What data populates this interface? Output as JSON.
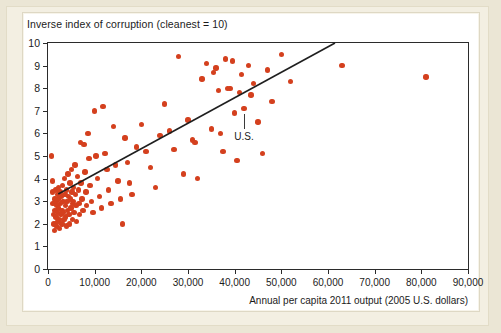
{
  "figure": {
    "panel_background": "#ffffff",
    "page_background": "#ebe6d5",
    "dot_color": "#d4401e",
    "axis_color": "#2b2b2b"
  },
  "chart_data": {
    "type": "scatter",
    "title": "Inverse index of corruption (cleanest = 10)",
    "xlabel": "Annual per capita 2011 output (2005 U.S. dollars)",
    "ylabel": "Inverse index of corruption (cleanest = 10)",
    "xlim": [
      0,
      90000
    ],
    "ylim": [
      0,
      10
    ],
    "grid": false,
    "legend": null,
    "xticks": [
      0,
      10000,
      20000,
      30000,
      40000,
      50000,
      60000,
      70000,
      80000,
      90000
    ],
    "xticklabels": [
      "0",
      "10,000",
      "20,000",
      "30,000",
      "40,000",
      "50,000",
      "60,000",
      "70,000",
      "80,000",
      "90,000"
    ],
    "yticks": [
      0,
      1,
      2,
      3,
      4,
      5,
      6,
      7,
      8,
      9,
      10
    ],
    "yticklabels": [
      "0",
      "1",
      "2",
      "3",
      "4",
      "5",
      "6",
      "7",
      "8",
      "9",
      "10"
    ],
    "trendline": {
      "label": "fitted regression line",
      "x_start": 2200,
      "y_start": 3.32,
      "x_end": 61500,
      "y_end": 10.0,
      "color": "#1f1f1f"
    },
    "annotations": [
      {
        "text": "U.S.",
        "point_x": 42000,
        "point_y": 7.1,
        "label_x": 42000,
        "label_y": 5.75
      }
    ],
    "points": [
      [
        700,
        5.0
      ],
      [
        900,
        3.9
      ],
      [
        1000,
        3.4
      ],
      [
        1100,
        2.9
      ],
      [
        1200,
        2.4
      ],
      [
        1300,
        2.0
      ],
      [
        1400,
        1.7
      ],
      [
        1500,
        3.1
      ],
      [
        1500,
        2.6
      ],
      [
        1600,
        3.5
      ],
      [
        1700,
        3.0
      ],
      [
        1700,
        2.3
      ],
      [
        1800,
        1.9
      ],
      [
        1900,
        2.8
      ],
      [
        2000,
        3.3
      ],
      [
        2000,
        2.5
      ],
      [
        2100,
        2.1
      ],
      [
        2200,
        3.6
      ],
      [
        2300,
        3.1
      ],
      [
        2300,
        2.7
      ],
      [
        2400,
        2.2
      ],
      [
        2500,
        1.8
      ],
      [
        2600,
        3.4
      ],
      [
        2700,
        2.9
      ],
      [
        2800,
        2.4
      ],
      [
        2900,
        3.2
      ],
      [
        3000,
        2.6
      ],
      [
        3000,
        2.0
      ],
      [
        3100,
        3.7
      ],
      [
        3200,
        3.0
      ],
      [
        3300,
        2.5
      ],
      [
        3400,
        2.2
      ],
      [
        3500,
        4.0
      ],
      [
        3600,
        3.3
      ],
      [
        3700,
        2.8
      ],
      [
        3800,
        2.3
      ],
      [
        3900,
        1.9
      ],
      [
        4000,
        3.5
      ],
      [
        4100,
        3.0
      ],
      [
        4200,
        2.6
      ],
      [
        4300,
        4.2
      ],
      [
        4400,
        3.2
      ],
      [
        4500,
        2.4
      ],
      [
        4600,
        2.0
      ],
      [
        4700,
        3.8
      ],
      [
        4800,
        3.1
      ],
      [
        4900,
        2.7
      ],
      [
        5000,
        4.4
      ],
      [
        5100,
        3.4
      ],
      [
        5200,
        2.9
      ],
      [
        5300,
        2.2
      ],
      [
        5400,
        3.6
      ],
      [
        5500,
        3.0
      ],
      [
        5600,
        2.5
      ],
      [
        5800,
        4.6
      ],
      [
        5900,
        3.3
      ],
      [
        6000,
        2.8
      ],
      [
        6100,
        2.1
      ],
      [
        6300,
        4.1
      ],
      [
        6500,
        3.5
      ],
      [
        6600,
        2.9
      ],
      [
        6800,
        2.4
      ],
      [
        7000,
        5.6
      ],
      [
        7100,
        3.8
      ],
      [
        7300,
        3.1
      ],
      [
        7500,
        2.6
      ],
      [
        7700,
        5.5
      ],
      [
        7900,
        4.3
      ],
      [
        8100,
        3.4
      ],
      [
        8300,
        2.8
      ],
      [
        8600,
        6.0
      ],
      [
        8800,
        4.9
      ],
      [
        9000,
        3.7
      ],
      [
        9300,
        3.0
      ],
      [
        9600,
        2.5
      ],
      [
        10000,
        7.0
      ],
      [
        10300,
        5.0
      ],
      [
        10600,
        4.0
      ],
      [
        11000,
        3.2
      ],
      [
        11400,
        2.7
      ],
      [
        11800,
        7.2
      ],
      [
        12200,
        5.1
      ],
      [
        12600,
        4.4
      ],
      [
        13000,
        3.5
      ],
      [
        13500,
        2.9
      ],
      [
        14000,
        6.3
      ],
      [
        14500,
        4.6
      ],
      [
        15000,
        3.9
      ],
      [
        15500,
        3.1
      ],
      [
        16000,
        2.0
      ],
      [
        16500,
        5.8
      ],
      [
        17000,
        4.7
      ],
      [
        17500,
        3.8
      ],
      [
        18000,
        3.3
      ],
      [
        19000,
        5.4
      ],
      [
        20000,
        6.4
      ],
      [
        21000,
        5.2
      ],
      [
        22000,
        4.5
      ],
      [
        23000,
        3.6
      ],
      [
        24000,
        5.9
      ],
      [
        25000,
        7.3
      ],
      [
        26000,
        6.1
      ],
      [
        27000,
        5.3
      ],
      [
        28000,
        9.4
      ],
      [
        29000,
        4.2
      ],
      [
        30000,
        6.6
      ],
      [
        31000,
        5.7
      ],
      [
        31500,
        5.6
      ],
      [
        32000,
        4.0
      ],
      [
        33000,
        8.4
      ],
      [
        34000,
        9.1
      ],
      [
        35000,
        6.2
      ],
      [
        35500,
        8.7
      ],
      [
        36000,
        8.9
      ],
      [
        36500,
        7.9
      ],
      [
        37000,
        6.0
      ],
      [
        37500,
        5.2
      ],
      [
        38000,
        9.3
      ],
      [
        38500,
        8.0
      ],
      [
        39000,
        8.0
      ],
      [
        39500,
        9.2
      ],
      [
        40000,
        6.9
      ],
      [
        40500,
        4.8
      ],
      [
        41000,
        7.8
      ],
      [
        41500,
        8.6
      ],
      [
        42000,
        7.1
      ],
      [
        43000,
        9.0
      ],
      [
        43500,
        7.7
      ],
      [
        44000,
        8.2
      ],
      [
        45000,
        6.5
      ],
      [
        46000,
        5.1
      ],
      [
        47000,
        8.8
      ],
      [
        48000,
        7.4
      ],
      [
        50000,
        9.5
      ],
      [
        52000,
        8.3
      ],
      [
        63000,
        9.0
      ],
      [
        81000,
        8.5
      ]
    ]
  }
}
